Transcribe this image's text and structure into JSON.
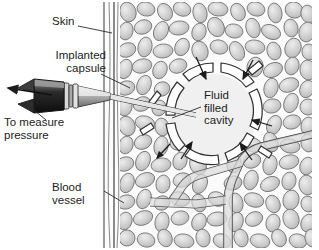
{
  "figure": {
    "background_color": "#ffffff",
    "width": 319,
    "height": 250
  },
  "labels": {
    "skin": "Skin",
    "implanted_capsule_line1": "Implanted",
    "implanted_capsule_line2": "capsule",
    "to_measure_line1": "To measure",
    "to_measure_line2": "pressure",
    "blood_vessel_line1": "Blood",
    "blood_vessel_line2": "vessel",
    "fluid_cavity_line1": "Fluid",
    "fluid_cavity_line2": "filled",
    "fluid_cavity_line3": "cavity"
  },
  "colors": {
    "ink": "#1c1c1c",
    "outline": "#3a3a3a",
    "cell_fill": "#cfcfcf",
    "cell_stroke": "#6d6d6d",
    "cell_highlight": "#e8e8e8",
    "cavity_fill": "#f0f0f0",
    "capsule_fill": "#ffffff",
    "capsule_stroke": "#333333",
    "vessel_fill": "#dcdcdc",
    "vessel_stroke": "#444444",
    "skin_line": "#4a4a4a",
    "needle_dark": "#1a1a1a",
    "needle_mid": "#7a7a7a",
    "needle_light": "#c8c8c8",
    "leader_line": "#2a2a2a"
  },
  "parts": {
    "skin_band": "vertical striated skin layer",
    "tissue_field": "subcutaneous adipose tissue cells",
    "capsule_ring": "perforated implanted capsule wall segments",
    "cavity": "fluid filled cavity at capsule center",
    "blood_vessel": "branching blood vessel",
    "needle": "hypodermic needle and hub assembly",
    "flow_arrows": "fluid exchange arrows across capsule wall",
    "measure_arrow": "arrow to pressure measuring device"
  }
}
